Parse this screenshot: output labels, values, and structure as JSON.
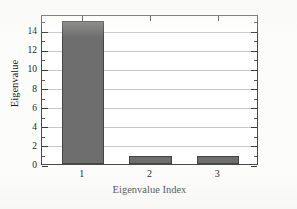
{
  "chart_data": {
    "type": "bar",
    "title": "",
    "subtitle": "",
    "xlabel": "Eigenvalue Index",
    "ylabel": "Eigenvalue",
    "categories": [
      "1",
      "2",
      "3"
    ],
    "values": [
      15.0,
      0.85,
      0.85
    ],
    "series": [
      {
        "name": "Eigenvalue",
        "values": [
          15.0,
          0.85,
          0.85
        ]
      }
    ],
    "ylim": [
      0,
      15.7
    ],
    "xlim": [
      0.4,
      3.6
    ],
    "yticks": [
      0,
      2,
      4,
      6,
      8,
      10,
      12,
      14
    ],
    "ytick_labels": [
      "0",
      "2",
      "4",
      "6",
      "8",
      "10",
      "12",
      "14"
    ],
    "yminor_ticks": [
      1,
      3,
      5,
      7,
      9,
      11,
      13,
      15
    ],
    "xticks": [
      1,
      2,
      3
    ],
    "xtick_labels": [
      "1",
      "2",
      "3"
    ],
    "grid": "horizontal",
    "legend": "none",
    "bar_color": "#6e6e6e",
    "bar_edge_color": "#444444",
    "axis_color": "#4a4a4a",
    "grid_color": "#c9c9c9",
    "plot_background": "#ffffff",
    "figure_background": "#fcfcfb",
    "annotations": []
  }
}
